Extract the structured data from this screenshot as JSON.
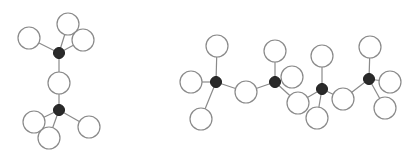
{
  "diagram": {
    "colors": {
      "bond": "#8a8a8a",
      "center_atom": "#2a2a2a",
      "outer_atom_fill": "#ffffff",
      "outer_atom_stroke": "#8a8a8a"
    },
    "molecules": [
      {
        "name": "molecule-left",
        "center_atoms": [
          [
            59,
            53
          ],
          [
            59,
            110
          ]
        ],
        "outer_atoms": [
          [
            29,
            38
          ],
          [
            68,
            24
          ],
          [
            83,
            40
          ],
          [
            59,
            83
          ],
          [
            34,
            122
          ],
          [
            49,
            138
          ],
          [
            89,
            127
          ]
        ],
        "bonds": [
          [
            [
              59,
              53
            ],
            [
              29,
              38
            ]
          ],
          [
            [
              59,
              53
            ],
            [
              68,
              24
            ]
          ],
          [
            [
              59,
              53
            ],
            [
              83,
              40
            ]
          ],
          [
            [
              59,
              53
            ],
            [
              59,
              83
            ]
          ],
          [
            [
              59,
              83
            ],
            [
              59,
              110
            ]
          ],
          [
            [
              59,
              110
            ],
            [
              34,
              122
            ]
          ],
          [
            [
              59,
              110
            ],
            [
              49,
              138
            ]
          ],
          [
            [
              59,
              110
            ],
            [
              89,
              127
            ]
          ]
        ]
      },
      {
        "name": "molecule-right",
        "center_atoms": [
          [
            216,
            82
          ],
          [
            275,
            82
          ],
          [
            322,
            89
          ],
          [
            369,
            79
          ]
        ],
        "outer_atoms": [
          [
            217,
            46
          ],
          [
            191,
            82
          ],
          [
            201,
            119
          ],
          [
            246,
            92
          ],
          [
            275,
            51
          ],
          [
            292,
            77
          ],
          [
            298,
            103
          ],
          [
            322,
            56
          ],
          [
            317,
            118
          ],
          [
            343,
            99
          ],
          [
            370,
            47
          ],
          [
            390,
            82
          ],
          [
            385,
            108
          ]
        ],
        "bonds": [
          [
            [
              216,
              82
            ],
            [
              217,
              46
            ]
          ],
          [
            [
              216,
              82
            ],
            [
              191,
              82
            ]
          ],
          [
            [
              216,
              82
            ],
            [
              201,
              119
            ]
          ],
          [
            [
              216,
              82
            ],
            [
              246,
              92
            ]
          ],
          [
            [
              246,
              92
            ],
            [
              275,
              82
            ]
          ],
          [
            [
              275,
              82
            ],
            [
              275,
              51
            ]
          ],
          [
            [
              275,
              82
            ],
            [
              292,
              77
            ]
          ],
          [
            [
              275,
              82
            ],
            [
              298,
              103
            ]
          ],
          [
            [
              298,
              103
            ],
            [
              322,
              89
            ]
          ],
          [
            [
              322,
              89
            ],
            [
              322,
              56
            ]
          ],
          [
            [
              322,
              89
            ],
            [
              317,
              118
            ]
          ],
          [
            [
              322,
              89
            ],
            [
              343,
              99
            ]
          ],
          [
            [
              343,
              99
            ],
            [
              369,
              79
            ]
          ],
          [
            [
              369,
              79
            ],
            [
              370,
              47
            ]
          ],
          [
            [
              369,
              79
            ],
            [
              390,
              82
            ]
          ],
          [
            [
              369,
              79
            ],
            [
              385,
              108
            ]
          ]
        ]
      }
    ],
    "outer_radius": 11,
    "center_radius": 5.5
  }
}
